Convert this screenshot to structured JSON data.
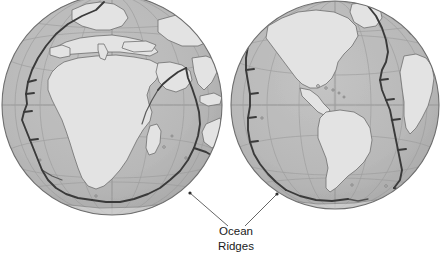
{
  "figure": {
    "background_color": "#ffffff",
    "width": 446,
    "height": 260
  },
  "palette": {
    "ocean_fill": "#b8b8b8",
    "ocean_fill_shadow": "#ababab",
    "land_fill": "#e3e3e3",
    "land_stroke": "#707070",
    "ridge_stroke": "#3a3a3a",
    "graticule_stroke": "#9a9a9a",
    "globe_outline": "#6e6e6e",
    "label_color": "#1a1a1a",
    "leader_color": "#555555"
  },
  "globes": [
    {
      "name": "eastern-hemisphere-globe",
      "center_label": "Africa / Indian Ocean",
      "cx": 112,
      "cy": 105,
      "r": 110
    },
    {
      "name": "western-hemisphere-globe",
      "center_label": "Americas / Atlantic Ocean",
      "cx": 335,
      "cy": 105,
      "r": 104
    }
  ],
  "annotation": {
    "name": "ocean-ridges-label",
    "line1": "Ocean",
    "line2": "Ridges",
    "text_x": 236,
    "line1_y": 235,
    "line2_y": 250,
    "leaders": [
      {
        "name": "leader-left",
        "x1": 228,
        "y1": 226,
        "x2": 190,
        "y2": 193
      },
      {
        "name": "leader-right",
        "x1": 245,
        "y1": 226,
        "x2": 277,
        "y2": 194
      }
    ]
  }
}
